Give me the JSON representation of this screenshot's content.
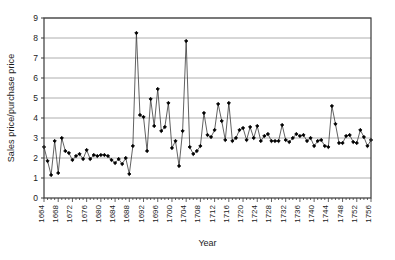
{
  "chart_data": {
    "type": "line",
    "title": "",
    "xlabel": "Year",
    "ylabel": "Sales price/purchase price",
    "xlim": [
      1664,
      1756
    ],
    "ylim": [
      0,
      9
    ],
    "ytick_values": [
      0,
      1,
      2,
      3,
      4,
      5,
      6,
      7,
      8,
      9
    ],
    "ytick_labels": [
      "0",
      "1",
      "2",
      "3",
      "4",
      "5",
      "6",
      "7",
      "8",
      "9"
    ],
    "xtick_labels": [
      "1664",
      "1668",
      "1672",
      "1676",
      "1680",
      "1684",
      "1688",
      "1692",
      "1696",
      "1700",
      "1704",
      "1708",
      "1712",
      "1716",
      "1720",
      "1724",
      "1728",
      "1732",
      "1736",
      "1740",
      "1744",
      "1748",
      "1752",
      "1756"
    ],
    "xtick_step": 4,
    "grid": "horizontal",
    "legend": "none",
    "marker": "filled-diamond",
    "line_color": "#3a3a3a",
    "marker_color": "#000000",
    "grid_color": "#9a9a9a",
    "axis_color": "#3a3a3a",
    "x": [
      1664,
      1665,
      1666,
      1667,
      1668,
      1669,
      1670,
      1671,
      1672,
      1673,
      1674,
      1675,
      1676,
      1677,
      1678,
      1679,
      1680,
      1681,
      1682,
      1683,
      1684,
      1685,
      1686,
      1687,
      1688,
      1689,
      1690,
      1691,
      1692,
      1693,
      1694,
      1695,
      1696,
      1697,
      1698,
      1699,
      1700,
      1701,
      1702,
      1703,
      1704,
      1705,
      1706,
      1707,
      1708,
      1709,
      1710,
      1711,
      1712,
      1713,
      1714,
      1715,
      1716,
      1717,
      1718,
      1719,
      1720,
      1721,
      1722,
      1723,
      1724,
      1725,
      1726,
      1727,
      1728,
      1729,
      1730,
      1731,
      1732,
      1733,
      1734,
      1735,
      1736,
      1737,
      1738,
      1739,
      1740,
      1741,
      1742,
      1743,
      1744,
      1745,
      1746,
      1747,
      1748,
      1749,
      1750,
      1751,
      1752,
      1753,
      1754,
      1755,
      1756
    ],
    "values": [
      2.55,
      1.85,
      1.15,
      2.85,
      1.25,
      3.0,
      2.35,
      2.25,
      1.9,
      2.1,
      2.2,
      1.95,
      2.4,
      1.95,
      2.15,
      2.1,
      2.15,
      2.15,
      2.1,
      1.9,
      1.75,
      1.95,
      1.7,
      2.0,
      1.2,
      2.6,
      8.25,
      4.15,
      4.05,
      2.35,
      4.95,
      3.6,
      5.45,
      3.35,
      3.55,
      4.75,
      2.5,
      2.85,
      1.6,
      3.35,
      7.85,
      2.55,
      2.2,
      2.35,
      2.6,
      4.25,
      3.15,
      3.05,
      3.4,
      4.7,
      3.85,
      2.9,
      4.75,
      2.85,
      3.0,
      3.4,
      3.5,
      2.9,
      3.55,
      3.0,
      3.6,
      2.85,
      3.1,
      3.2,
      2.85,
      2.85,
      2.85,
      3.65,
      2.9,
      2.8,
      3.0,
      3.2,
      3.1,
      3.15,
      2.85,
      3.0,
      2.6,
      2.85,
      2.9,
      2.6,
      2.55,
      4.6,
      3.7,
      2.75,
      2.75,
      3.1,
      3.15,
      2.8,
      2.75,
      3.4,
      3.05,
      2.6,
      2.9
    ]
  }
}
